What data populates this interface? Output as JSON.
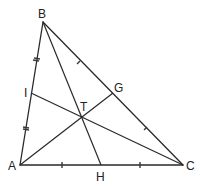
{
  "diagram": {
    "type": "triangle-medians",
    "colors": {
      "line": "#2a2a2a",
      "background": "#ffffff",
      "label": "#222222"
    },
    "labels": {
      "A": "A",
      "B": "B",
      "C": "C",
      "H": "H",
      "I": "I",
      "G": "G",
      "T": "T"
    },
    "points": {
      "A": [
        20,
        165
      ],
      "B": [
        43,
        22
      ],
      "C": [
        183,
        165
      ],
      "H": [
        101,
        165
      ],
      "I": [
        31,
        93
      ],
      "G": [
        113,
        93
      ],
      "T": [
        82,
        117
      ]
    },
    "segments": [
      "AB",
      "BC",
      "CA",
      "AG",
      "BH",
      "CI"
    ],
    "equal_marks": {
      "AI_IB": "double-dash",
      "AH_HC": "single-dash",
      "BG_GC": "single-tick"
    }
  }
}
